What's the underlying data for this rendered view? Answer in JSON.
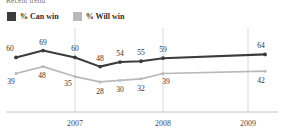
{
  "chart_data": {
    "type": "line",
    "title": "Recent trend",
    "xlabel": "",
    "ylabel": "",
    "grid": true,
    "gridlines_x": [
      "2007",
      "2008",
      "2009"
    ],
    "legend_position": "top-left",
    "xtick_labels": [
      "2007",
      "2008",
      "2009"
    ],
    "x": [
      0,
      1,
      2,
      3,
      4,
      5,
      6,
      7
    ],
    "series": [
      {
        "name": "% Can win",
        "color": "#3c3c3c",
        "values": [
          60,
          69,
          60,
          48,
          54,
          55,
          59,
          64
        ],
        "labels": [
          "60",
          "69",
          "60",
          "48",
          "54",
          "55",
          "59",
          "64"
        ]
      },
      {
        "name": "% Will win",
        "color": "#b9b9b9",
        "values": [
          39,
          48,
          35,
          28,
          30,
          32,
          39,
          42
        ],
        "labels": [
          "39",
          "48",
          "35",
          "28",
          "30",
          "32",
          "39",
          "42"
        ]
      }
    ],
    "ylim": [
      20,
      75
    ]
  },
  "header": {
    "title": "Recent trend"
  },
  "legend": {
    "items": [
      {
        "label": "% Can win",
        "color": "#3c3c3c"
      },
      {
        "label": "% Will win",
        "color": "#b9b9b9"
      }
    ]
  },
  "axis": {
    "ticks": [
      {
        "label": "2007"
      },
      {
        "label": "2008"
      },
      {
        "label": "2009"
      }
    ]
  },
  "colors": {
    "can_win": "#3c3c3c",
    "will_win": "#b9b9b9",
    "gridline": "#cfcfcf",
    "axis": "#bdbdbd",
    "text": "#333333"
  }
}
